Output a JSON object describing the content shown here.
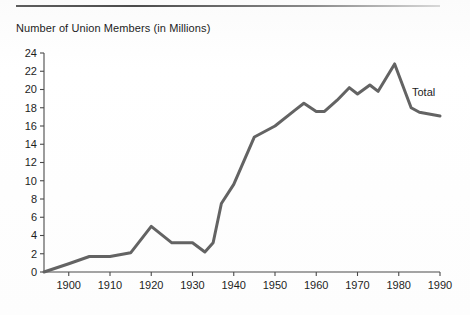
{
  "figure": {
    "title": "Number of Union Members (in Millions)",
    "top_rule": "horizontal-rule"
  },
  "chart_data": {
    "type": "line",
    "title": "Number of Union Members (in Millions)",
    "subtitle": "",
    "xlabel": "",
    "ylabel": "Number of Union Members (in Millions)",
    "xlim": [
      1894,
      1990
    ],
    "ylim": [
      0,
      24
    ],
    "grid": false,
    "legend_position": "inline-right",
    "x_ticks": [
      1900,
      1910,
      1920,
      1930,
      1940,
      1950,
      1960,
      1970,
      1980,
      1990
    ],
    "x_tick_labels": [
      "1900",
      "1910",
      "1920",
      "1930",
      "1940",
      "1950",
      "1960",
      "1970",
      "1980",
      "1990"
    ],
    "y_ticks": [
      0,
      2,
      4,
      6,
      8,
      10,
      12,
      14,
      16,
      18,
      20,
      22,
      24
    ],
    "y_tick_labels": [
      "0",
      "2",
      "4",
      "6",
      "8",
      "10",
      "12",
      "14",
      "16",
      "18",
      "20",
      "22",
      "24"
    ],
    "line_color": "#636363",
    "line_width": 3,
    "series": [
      {
        "name": "Total",
        "annotation": "Total",
        "x": [
          1894,
          1900,
          1905,
          1910,
          1915,
          1920,
          1925,
          1930,
          1933,
          1935,
          1937,
          1940,
          1945,
          1950,
          1955,
          1957,
          1960,
          1962,
          1965,
          1968,
          1970,
          1973,
          1975,
          1979,
          1983,
          1985,
          1990
        ],
        "y": [
          0.0,
          0.9,
          1.7,
          1.7,
          2.1,
          5.0,
          3.2,
          3.2,
          2.2,
          3.2,
          7.5,
          9.6,
          14.8,
          16.0,
          17.8,
          18.5,
          17.6,
          17.6,
          18.8,
          20.2,
          19.5,
          20.5,
          19.8,
          22.8,
          18.0,
          17.5,
          17.1
        ]
      }
    ]
  }
}
